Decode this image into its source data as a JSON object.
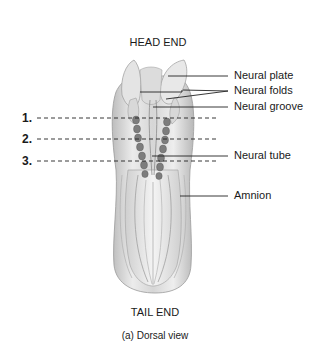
{
  "figure": {
    "top_label": "HEAD END",
    "bottom_label": "TAIL END",
    "caption": "(a) Dorsal view",
    "view": "Dorsal view"
  },
  "labels": [
    {
      "text": "Neural plate",
      "x": 234,
      "y": 76
    },
    {
      "text": "Neural folds",
      "x": 234,
      "y": 91
    },
    {
      "text": "Neural groove",
      "x": 234,
      "y": 107
    },
    {
      "text": "Neural tube",
      "x": 234,
      "y": 156
    },
    {
      "text": "Amnion",
      "x": 234,
      "y": 196
    }
  ],
  "section_lines": [
    {
      "number": "1.",
      "y": 118
    },
    {
      "number": "2.",
      "y": 139
    },
    {
      "number": "3.",
      "y": 161
    }
  ],
  "colors": {
    "text": "#1a1a1a",
    "line": "#222222",
    "embryo_light": "#e8e8e8",
    "embryo_mid": "#c4c4c4",
    "embryo_dark": "#6e6e6e",
    "somite": "#8a8a8a"
  }
}
